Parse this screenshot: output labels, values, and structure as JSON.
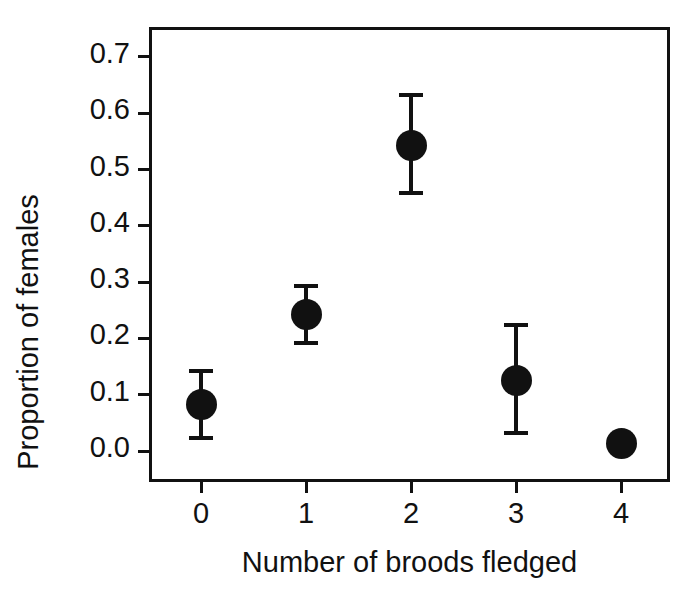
{
  "chart_data": {
    "type": "scatter",
    "title": "",
    "xlabel": "Number of broods fledged",
    "ylabel": "Proportion of females",
    "grid": false,
    "legend": null,
    "xlim": [
      -0.5,
      4.5
    ],
    "ylim": [
      -0.035,
      0.775
    ],
    "x_tick_labels": [
      "0",
      "1",
      "2",
      "3",
      "4"
    ],
    "y_tick_labels": [
      "0.0",
      "0.1",
      "0.2",
      "0.3",
      "0.4",
      "0.5",
      "0.6",
      "0.7"
    ],
    "x_ticks": [
      0,
      1,
      2,
      3,
      4
    ],
    "y_ticks": [
      0.0,
      0.1,
      0.2,
      0.3,
      0.4,
      0.5,
      0.6,
      0.7
    ],
    "marker": "filled-circle",
    "marker_color": "#111111",
    "errorbar_color": "#111111",
    "categories": [
      "0",
      "1",
      "2",
      "3",
      "4"
    ],
    "values": [
      0.083,
      0.243,
      0.542,
      0.126,
      0.014
    ],
    "error_upper": [
      0.142,
      0.293,
      0.632,
      0.224,
      0.023
    ],
    "error_lower": [
      0.023,
      0.192,
      0.458,
      0.032,
      0.005
    ],
    "points": [
      {
        "x": 0,
        "y": 0.083,
        "hi": 0.142,
        "lo": 0.023
      },
      {
        "x": 1,
        "y": 0.243,
        "hi": 0.293,
        "lo": 0.192
      },
      {
        "x": 2,
        "y": 0.542,
        "hi": 0.632,
        "lo": 0.458
      },
      {
        "x": 3,
        "y": 0.126,
        "hi": 0.224,
        "lo": 0.032
      },
      {
        "x": 4,
        "y": 0.014,
        "hi": 0.023,
        "lo": 0.005
      }
    ]
  }
}
